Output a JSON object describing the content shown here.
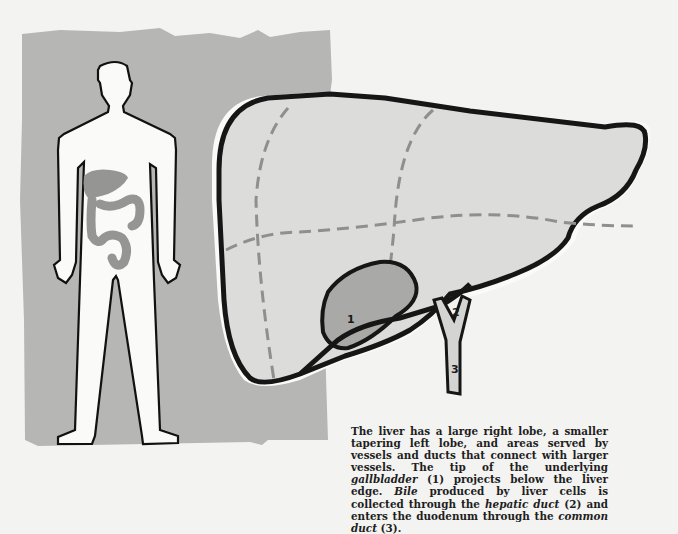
{
  "figure": {
    "colors": {
      "background": "#f3f3f1",
      "panel_gray": "#b6b6b4",
      "liver_fill": "#dcdcda",
      "gallbladder_fill": "#a9a9a7",
      "body_organs": "#9a9a98",
      "outline": "#1a1a1a",
      "dashes": "#8f8f8d"
    },
    "labels": {
      "gallbladder_num": "1",
      "hepatic_duct_num": "2",
      "common_duct_num": "3"
    }
  },
  "caption": {
    "part1": "The liver has a large right lobe, a smaller tapering left lobe, and areas served by vessels and ducts that connect with larger vessels. The tip of the underlying ",
    "gallbladder": "gallbladder",
    "part2": " (1) projects below the liver edge. ",
    "bile": "Bile",
    "part3": " produced by liver cells is collected through the ",
    "hepatic_duct": "hepatic duct",
    "part4": " (2) and enters the duodenum through the ",
    "common_duct": "common duct",
    "part5": " (3)."
  }
}
